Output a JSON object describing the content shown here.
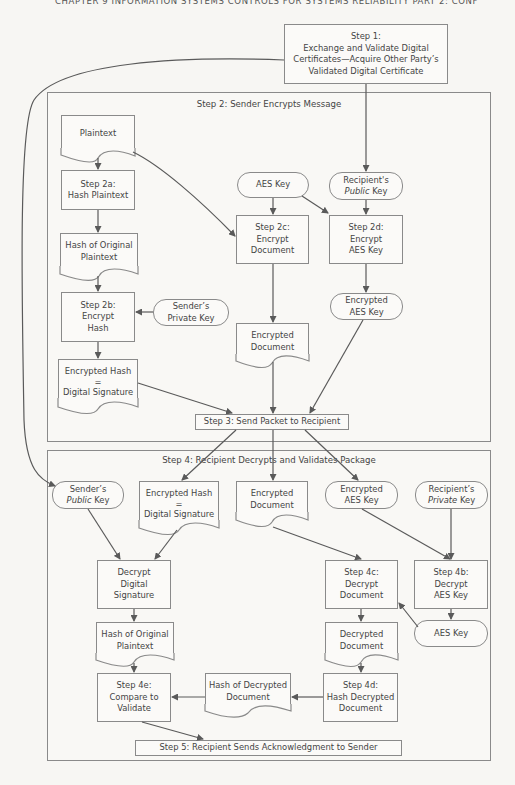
{
  "page_header": "CHAPTER 9   INFORMATION SYSTEMS CONTROLS FOR SYSTEMS RELIABILITY   PART 2: CONF",
  "step1": {
    "label": "Step 1:\nExchange and Validate Digital\nCertificates—Acquire Other Party’s\nValidated Digital Certificate"
  },
  "step2": {
    "title": "Step 2: Sender Encrypts Message",
    "plaintext": "Plaintext",
    "step2a": "Step 2a:\nHash Plaintext",
    "hash_original": "Hash of Original\nPlaintext",
    "step2b": "Step 2b:\nEncrypt\nHash",
    "sender_private_key": "Sender’s\nPrivate Key",
    "encrypted_hash": "Encrypted Hash\n=\nDigital Signature",
    "aes_key": "AES Key",
    "recipient_public_key_line1": "Recipient's",
    "recipient_public_key_italic": "Public",
    "recipient_public_key_tail": " Key",
    "step2c": "Step 2c:\nEncrypt\nDocument",
    "step2d": "Step 2d:\nEncrypt\nAES Key",
    "encrypted_document": "Encrypted\nDocument",
    "encrypted_aes_key": "Encrypted\nAES Key"
  },
  "step3": {
    "label": "Step 3: Send Packet to Recipient"
  },
  "step4": {
    "title": "Step 4: Recipient Decrypts and Validates Package",
    "sender_public_key_line1": "Sender’s",
    "sender_public_key_italic": "Public",
    "sender_public_key_tail": " Key",
    "encrypted_hash": "Encrypted Hash\n=\nDigital Signature",
    "encrypted_document": "Encrypted\nDocument",
    "encrypted_aes_key": "Encrypted\nAES Key",
    "recipient_private_key_line1": "Recipient’s",
    "recipient_private_key_italic": "Private",
    "recipient_private_key_tail": " Key",
    "decrypt_signature": "Decrypt\nDigital\nSignature",
    "step4c": "Step 4c:\nDecrypt\nDocument",
    "step4b": "Step 4b:\nDecrypt\nAES Key",
    "aes_key": "AES Key",
    "hash_original": "Hash of Original\nPlaintext",
    "decrypted_document": "Decrypted\nDocument",
    "step4e": "Step 4e:\nCompare to\nValidate",
    "hash_decrypted": "Hash of Decrypted\nDocument",
    "step4d": "Step 4d:\nHash Decrypted\nDocument"
  },
  "step5": {
    "label": "Step 5: Recipient Sends Acknowledgment to Sender"
  },
  "colors": {
    "line": "#5a5a5a",
    "border": "#8a8a8a",
    "background": "#f7f6f3",
    "text": "#444444"
  }
}
